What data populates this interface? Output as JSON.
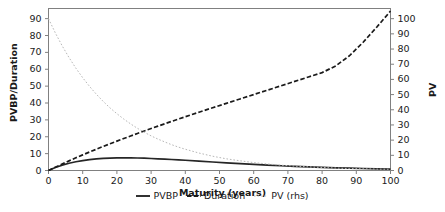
{
  "chart_data": {
    "type": "line",
    "title": "",
    "xlabel": "Maturity (years)",
    "ylabel": "PVBP/Duration",
    "y2label": "PV",
    "xlim": [
      0,
      100
    ],
    "ylim": [
      0,
      96
    ],
    "y2lim": [
      0,
      106.7
    ],
    "grid": false,
    "legend_position": "bottom-center",
    "xticks": [
      "0",
      "10",
      "20",
      "30",
      "40",
      "50",
      "60",
      "70",
      "80",
      "90",
      "100"
    ],
    "xtick_values": [
      0,
      10,
      20,
      30,
      40,
      50,
      60,
      70,
      80,
      90,
      100
    ],
    "yticks": [
      "0",
      "10",
      "20",
      "30",
      "40",
      "50",
      "60",
      "70",
      "80",
      "90"
    ],
    "ytick_values": [
      0,
      10,
      20,
      30,
      40,
      50,
      60,
      70,
      80,
      90
    ],
    "y2ticks": [
      "0",
      "10",
      "20",
      "30",
      "40",
      "50",
      "60",
      "70",
      "80",
      "90",
      "100"
    ],
    "y2tick_values": [
      0,
      10,
      20,
      30,
      40,
      50,
      60,
      70,
      80,
      90,
      100
    ],
    "x": [
      0,
      2,
      4,
      6,
      8,
      10,
      12,
      14,
      16,
      18,
      20,
      22,
      24,
      26,
      28,
      30,
      32,
      34,
      36,
      38,
      40,
      44,
      48,
      52,
      56,
      60,
      64,
      68,
      72,
      76,
      80,
      84,
      88,
      92,
      96,
      100
    ],
    "series": [
      {
        "name": "PVBP",
        "axis": "left",
        "style": "solid",
        "color": "#262626",
        "values": [
          0.0,
          1.75,
          3.15,
          4.3,
          5.2,
          5.9,
          6.45,
          6.85,
          7.15,
          7.35,
          7.45,
          7.5,
          7.48,
          7.4,
          7.28,
          7.12,
          6.94,
          6.74,
          6.52,
          6.3,
          6.06,
          5.56,
          5.05,
          4.55,
          4.07,
          3.62,
          3.2,
          2.82,
          2.47,
          2.15,
          1.86,
          1.6,
          1.38,
          1.18,
          1.0,
          0.85
        ]
      },
      {
        "name": "Duration",
        "axis": "left",
        "style": "dashed",
        "color": "#1a1a1a",
        "values": [
          0.0,
          1.95,
          3.85,
          5.7,
          7.5,
          9.25,
          10.95,
          12.6,
          14.25,
          15.85,
          17.4,
          18.95,
          20.45,
          21.95,
          23.4,
          24.85,
          26.3,
          27.7,
          29.1,
          30.5,
          31.85,
          34.55,
          37.2,
          39.8,
          42.4,
          45.0,
          47.6,
          50.2,
          52.8,
          55.4,
          58.0,
          62.0,
          68.0,
          76.0,
          85.0,
          94.5
        ]
      },
      {
        "name": "PV (rhs)",
        "axis": "right",
        "style": "dotted",
        "color": "#b8b8b8",
        "values": [
          100.0,
          90.6,
          82.1,
          74.4,
          67.4,
          61.1,
          55.4,
          50.2,
          45.5,
          41.2,
          37.4,
          33.9,
          30.7,
          27.8,
          25.2,
          22.8,
          20.7,
          18.8,
          17.0,
          15.4,
          14.0,
          11.5,
          9.4,
          7.7,
          6.4,
          5.2,
          4.3,
          3.5,
          2.9,
          2.4,
          2.0,
          1.6,
          1.3,
          1.1,
          0.9,
          0.8
        ]
      }
    ],
    "legend_entries": [
      "PVBP",
      "Duration",
      "PV (rhs)"
    ]
  },
  "axes": {
    "frame_color": "#808080",
    "tick_color": "#808080",
    "text_color": "#1a1a1a"
  }
}
